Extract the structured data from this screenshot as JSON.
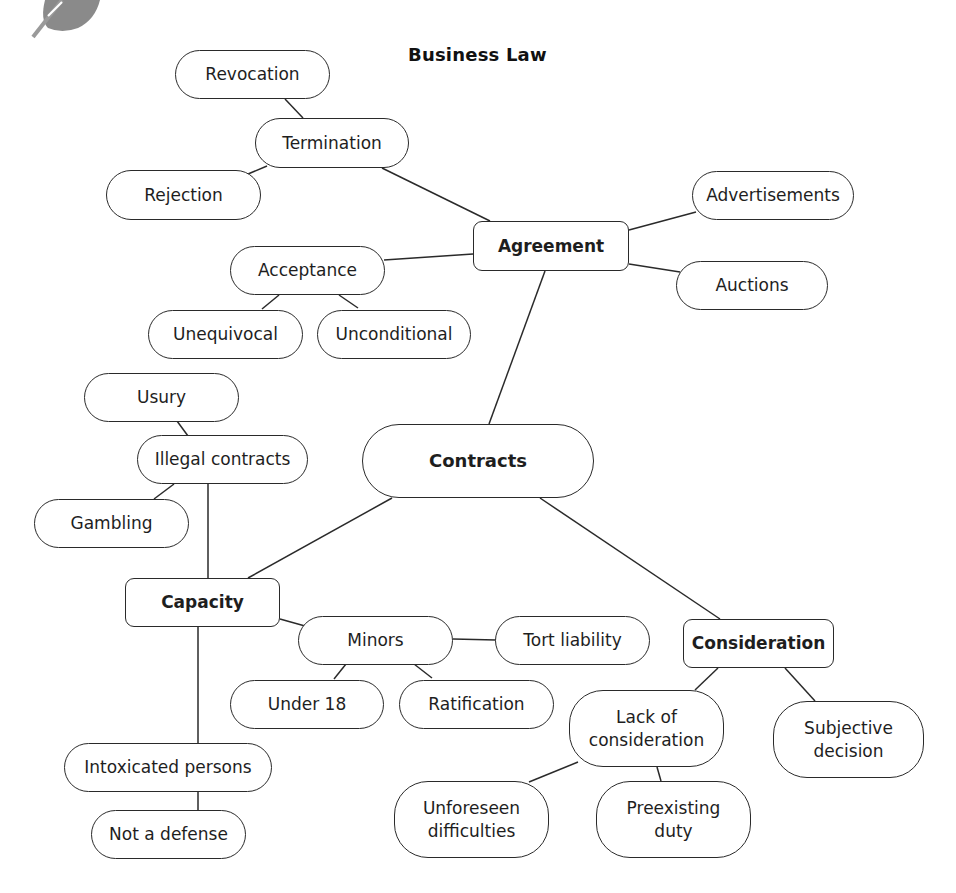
{
  "title": "Business Law",
  "logo": {
    "icon": "leaf-icon",
    "color": "#8a8a8a"
  },
  "colors": {
    "stroke": "#2a2a2a",
    "background": "#ffffff",
    "text": "#1e1e1e"
  },
  "nodes": {
    "revocation": {
      "label": "Revocation",
      "shape": "pill",
      "x": 175,
      "y": 50,
      "w": 155,
      "h": 49
    },
    "termination": {
      "label": "Termination",
      "shape": "pill",
      "x": 255,
      "y": 118,
      "w": 154,
      "h": 50
    },
    "rejection": {
      "label": "Rejection",
      "shape": "pill",
      "x": 106,
      "y": 170,
      "w": 155,
      "h": 50
    },
    "agreement": {
      "label": "Agreement",
      "shape": "box",
      "x": 473,
      "y": 221,
      "w": 156,
      "h": 50
    },
    "advertisements": {
      "label": "Advertisements",
      "shape": "pill",
      "x": 692,
      "y": 171,
      "w": 162,
      "h": 49
    },
    "auctions": {
      "label": "Auctions",
      "shape": "pill",
      "x": 676,
      "y": 261,
      "w": 152,
      "h": 49
    },
    "acceptance": {
      "label": "Acceptance",
      "shape": "pill",
      "x": 230,
      "y": 246,
      "w": 155,
      "h": 49
    },
    "unequivocal": {
      "label": "Unequivocal",
      "shape": "pill",
      "x": 148,
      "y": 310,
      "w": 155,
      "h": 49
    },
    "unconditional": {
      "label": "Unconditional",
      "shape": "pill",
      "x": 317,
      "y": 310,
      "w": 154,
      "h": 49
    },
    "usury": {
      "label": "Usury",
      "shape": "pill",
      "x": 84,
      "y": 373,
      "w": 155,
      "h": 49
    },
    "illegal": {
      "label": "Illegal contracts",
      "shape": "pill",
      "x": 137,
      "y": 435,
      "w": 171,
      "h": 49
    },
    "gambling": {
      "label": "Gambling",
      "shape": "pill",
      "x": 34,
      "y": 499,
      "w": 155,
      "h": 49
    },
    "contracts": {
      "label": "Contracts",
      "shape": "center",
      "x": 362,
      "y": 424,
      "w": 232,
      "h": 74
    },
    "capacity": {
      "label": "Capacity",
      "shape": "box",
      "x": 125,
      "y": 578,
      "w": 155,
      "h": 49
    },
    "minors": {
      "label": "Minors",
      "shape": "pill",
      "x": 298,
      "y": 616,
      "w": 155,
      "h": 49
    },
    "tort": {
      "label": "Tort liability",
      "shape": "pill",
      "x": 495,
      "y": 616,
      "w": 155,
      "h": 49
    },
    "under18": {
      "label": "Under 18",
      "shape": "pill",
      "x": 230,
      "y": 680,
      "w": 154,
      "h": 49
    },
    "ratification": {
      "label": "Ratification",
      "shape": "pill",
      "x": 399,
      "y": 680,
      "w": 155,
      "h": 49
    },
    "consideration": {
      "label": "Consideration",
      "shape": "box",
      "x": 683,
      "y": 619,
      "w": 151,
      "h": 49
    },
    "lack": {
      "label": "Lack of\nconsideration",
      "shape": "pill-tall",
      "x": 569,
      "y": 690,
      "w": 155,
      "h": 77
    },
    "subjective": {
      "label": "Subjective\ndecision",
      "shape": "pill-tall",
      "x": 773,
      "y": 701,
      "w": 151,
      "h": 77
    },
    "intoxicated": {
      "label": "Intoxicated persons",
      "shape": "pill",
      "x": 64,
      "y": 743,
      "w": 208,
      "h": 49
    },
    "notdefense": {
      "label": "Not a defense",
      "shape": "pill",
      "x": 91,
      "y": 810,
      "w": 155,
      "h": 49
    },
    "unforeseen": {
      "label": "Unforeseen\ndifficulties",
      "shape": "pill-tall",
      "x": 394,
      "y": 781,
      "w": 155,
      "h": 77
    },
    "preexisting": {
      "label": "Preexisting\nduty",
      "shape": "pill-tall",
      "x": 596,
      "y": 781,
      "w": 155,
      "h": 77
    }
  },
  "links": [
    {
      "from": "revocation",
      "to": "termination",
      "x1": 285,
      "y1": 99,
      "x2": 303,
      "y2": 118
    },
    {
      "from": "termination",
      "to": "rejection",
      "x1": 267,
      "y1": 166,
      "x2": 248,
      "y2": 174
    },
    {
      "from": "termination",
      "to": "agreement",
      "x1": 382,
      "y1": 168,
      "x2": 490,
      "y2": 221
    },
    {
      "from": "agreement",
      "to": "advertisements",
      "x1": 629,
      "y1": 230,
      "x2": 696,
      "y2": 212
    },
    {
      "from": "agreement",
      "to": "auctions",
      "x1": 629,
      "y1": 264,
      "x2": 680,
      "y2": 272
    },
    {
      "from": "agreement",
      "to": "acceptance",
      "x1": 473,
      "y1": 254,
      "x2": 384,
      "y2": 260
    },
    {
      "from": "acceptance",
      "to": "unequivocal",
      "x1": 279,
      "y1": 295,
      "x2": 262,
      "y2": 309
    },
    {
      "from": "acceptance",
      "to": "unconditional",
      "x1": 339,
      "y1": 295,
      "x2": 358,
      "y2": 308
    },
    {
      "from": "agreement",
      "to": "contracts",
      "x1": 545,
      "y1": 271,
      "x2": 489,
      "y2": 424
    },
    {
      "from": "usury",
      "to": "illegal",
      "x1": 177,
      "y1": 421,
      "x2": 188,
      "y2": 436
    },
    {
      "from": "illegal",
      "to": "gambling",
      "x1": 174,
      "y1": 484,
      "x2": 154,
      "y2": 499
    },
    {
      "from": "illegal",
      "to": "capacity",
      "x1": 208,
      "y1": 484,
      "x2": 208,
      "y2": 578
    },
    {
      "from": "contracts",
      "to": "capacity",
      "x1": 392,
      "y1": 498,
      "x2": 248,
      "y2": 578
    },
    {
      "from": "contracts",
      "to": "consideration",
      "x1": 540,
      "y1": 498,
      "x2": 720,
      "y2": 619
    },
    {
      "from": "capacity",
      "to": "minors",
      "x1": 280,
      "y1": 619,
      "x2": 305,
      "y2": 626
    },
    {
      "from": "minors",
      "to": "tort",
      "x1": 453,
      "y1": 639,
      "x2": 496,
      "y2": 640
    },
    {
      "from": "minors",
      "to": "under18",
      "x1": 346,
      "y1": 664,
      "x2": 334,
      "y2": 679
    },
    {
      "from": "minors",
      "to": "ratification",
      "x1": 414,
      "y1": 664,
      "x2": 432,
      "y2": 678
    },
    {
      "from": "capacity",
      "to": "intoxicated",
      "x1": 198,
      "y1": 627,
      "x2": 198,
      "y2": 743
    },
    {
      "from": "intoxicated",
      "to": "notdefense",
      "x1": 198,
      "y1": 792,
      "x2": 198,
      "y2": 810
    },
    {
      "from": "consideration",
      "to": "lack",
      "x1": 718,
      "y1": 668,
      "x2": 695,
      "y2": 690
    },
    {
      "from": "consideration",
      "to": "subjective",
      "x1": 785,
      "y1": 668,
      "x2": 815,
      "y2": 701
    },
    {
      "from": "lack",
      "to": "unforeseen",
      "x1": 578,
      "y1": 762,
      "x2": 529,
      "y2": 782
    },
    {
      "from": "lack",
      "to": "preexisting",
      "x1": 657,
      "y1": 767,
      "x2": 661,
      "y2": 781
    }
  ]
}
